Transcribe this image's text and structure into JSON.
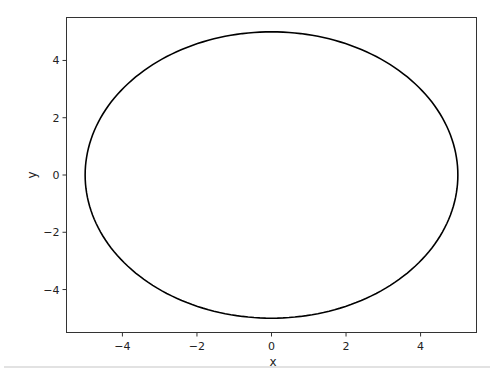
{
  "chart_data": {
    "type": "line",
    "title": "",
    "xlabel": "x",
    "ylabel": "y",
    "xlim": [
      -5.5,
      5.5
    ],
    "ylim": [
      -5.5,
      5.5
    ],
    "grid": false,
    "legend": null,
    "x_ticks": [
      -4,
      -2,
      0,
      2,
      4
    ],
    "y_ticks": [
      -4,
      -2,
      0,
      2,
      4
    ],
    "x_tick_labels": [
      "−4",
      "−2",
      "0",
      "2",
      "4"
    ],
    "y_tick_labels": [
      "−4",
      "−2",
      "0",
      "2",
      "4"
    ],
    "series": [
      {
        "name": "circle",
        "shape": "parametric circle x=5cos(t), y=5sin(t)",
        "center": [
          0,
          0
        ],
        "radius": 5,
        "color": "#000000",
        "x": [
          5,
          4.33,
          2.5,
          0,
          -2.5,
          -4.33,
          -5,
          -4.33,
          -2.5,
          0,
          2.5,
          4.33,
          5
        ],
        "y": [
          0,
          2.5,
          4.33,
          5,
          4.33,
          2.5,
          0,
          -2.5,
          -4.33,
          -5,
          -4.33,
          -2.5,
          0
        ]
      }
    ]
  },
  "labels": {
    "x_axis": "x",
    "y_axis": "y"
  }
}
